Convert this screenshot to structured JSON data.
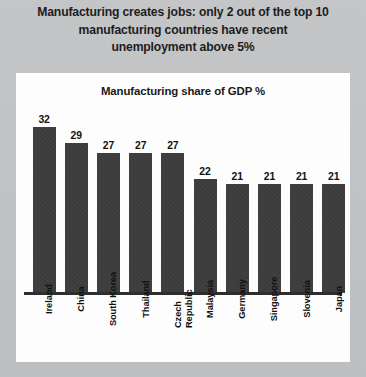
{
  "headline": {
    "lines": [
      "Manufacturing creates jobs: only 2 out of the top 10",
      "manufacturing countries have recent",
      "unemployment above 5%"
    ]
  },
  "colors": {
    "background": "#c3c4c6",
    "panel": "#fdfdfd",
    "bar": "#3c3c3c",
    "text": "#111111",
    "axis": "#2e2e2e"
  },
  "chart_data": {
    "type": "bar",
    "title": "Manufacturing share of GDP %",
    "xlabel": "",
    "ylabel": "",
    "ylim": [
      0,
      34
    ],
    "grid": false,
    "legend": false,
    "data_labels": true,
    "tick_label_rotation": -90,
    "categories": [
      "Ireland",
      "China",
      "South Korea",
      "Thailand",
      "Czech Republic",
      "Malaysia",
      "Germany",
      "Singapore",
      "Slovenia",
      "Japan"
    ],
    "values": [
      32,
      29,
      27,
      27,
      27,
      22,
      21,
      21,
      21,
      21
    ],
    "value_labels": [
      "32",
      "29",
      "27",
      "27",
      "27",
      "22",
      "21",
      "21",
      "21",
      "21"
    ]
  }
}
